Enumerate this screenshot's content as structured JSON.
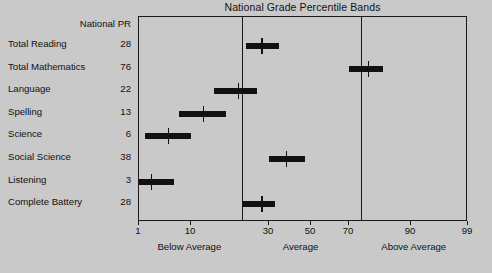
{
  "chart_data": {
    "type": "bar",
    "title": "National Grade Percentile Bands",
    "xlabel": "",
    "ylabel": "",
    "xscale": "percentile-normalized",
    "xlim": [
      1,
      99
    ],
    "grid": false,
    "legend": null,
    "column_header": "National PR",
    "tick_labels": [
      "1",
      "10",
      "30",
      "50",
      "70",
      "90",
      "99"
    ],
    "tick_values": [
      1,
      10,
      30,
      50,
      70,
      90,
      99
    ],
    "zone_labels": [
      "Below Average",
      "Average",
      "Above Average"
    ],
    "zone_boundaries": [
      23,
      74
    ],
    "categories": [
      "Total Reading",
      "Total Mathematics",
      "Language",
      "Spelling",
      "Science",
      "Social Science",
      "Listening",
      "Complete Battery"
    ],
    "values": [
      28,
      76,
      22,
      13,
      6,
      38,
      3,
      28
    ],
    "bands": [
      {
        "label": "Total Reading",
        "pr": 28,
        "marker": 28,
        "low": 24,
        "high": 35
      },
      {
        "label": "Total Mathematics",
        "pr": 76,
        "marker": 76,
        "low": 70,
        "high": 81
      },
      {
        "label": "Language",
        "pr": 22,
        "marker": 22,
        "low": 16,
        "high": 27
      },
      {
        "label": "Spelling",
        "pr": 13,
        "marker": 13,
        "low": 8,
        "high": 19
      },
      {
        "label": "Science",
        "pr": 6,
        "marker": 6,
        "low": 2,
        "high": 10
      },
      {
        "label": "Social Science",
        "pr": 38,
        "marker": 38,
        "low": 30,
        "high": 47
      },
      {
        "label": "Listening",
        "pr": 3,
        "marker": 3,
        "low": 1,
        "high": 7
      },
      {
        "label": "Complete Battery",
        "pr": 28,
        "marker": 28,
        "low": 23,
        "high": 33
      }
    ]
  },
  "colors": {
    "background": "#c9c9c9",
    "ink": "#111111",
    "frame": "#1a1a1a"
  }
}
